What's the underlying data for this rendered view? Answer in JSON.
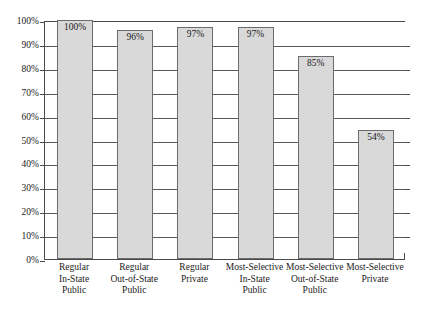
{
  "chart_data": {
    "type": "bar",
    "title": "",
    "xlabel": "",
    "ylabel": "",
    "ylim": [
      0,
      100
    ],
    "grid": true,
    "legend": "none",
    "categories": [
      "Regular\nIn-State\nPublic",
      "Regular\nOut-of-State\nPublic",
      "Regular\nPrivate",
      "Most-Selective\nIn-State\nPublic",
      "Most-Selective\nOut-of-State\nPublic",
      "Most-Selective\nPrivate"
    ],
    "values": [
      100,
      96,
      97,
      97,
      85,
      54
    ],
    "value_labels": [
      "100%",
      "96%",
      "97%",
      "97%",
      "85%",
      "54%"
    ],
    "ytick_labels": [
      "100%",
      "90%",
      "80%",
      "70%",
      "60%",
      "50%",
      "40%",
      "30%",
      "20%",
      "10%",
      "0%"
    ],
    "ytick_values": [
      100,
      90,
      80,
      70,
      60,
      50,
      40,
      30,
      20,
      10,
      0
    ],
    "bar_fill_color": "#d9d9d9",
    "bar_border_color": "#6b6b6b",
    "gridline_color": "#5a5a5a",
    "axis_color": "#4a4a4a",
    "background_color": "#ffffff"
  },
  "categories_lines": [
    [
      "Regular",
      "In-State",
      "Public"
    ],
    [
      "Regular",
      "Out-of-State",
      "Public"
    ],
    [
      "Regular",
      "Private"
    ],
    [
      "Most-Selective",
      "In-State",
      "Public"
    ],
    [
      "Most-Selective",
      "Out-of-State",
      "Public"
    ],
    [
      "Most-Selective",
      "Private"
    ]
  ]
}
